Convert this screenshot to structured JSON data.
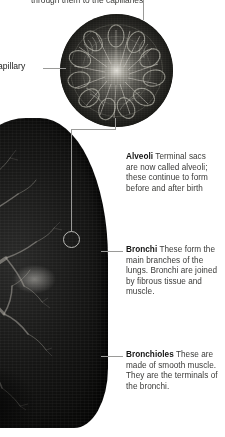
{
  "page": {
    "figure_type": "anatomical-illustration"
  },
  "top_fragment": {
    "text": "through them to the capillaries"
  },
  "side_label": {
    "text": "apillary",
    "full_word": "Capillary"
  },
  "callouts": [
    {
      "id": "alveoli",
      "term": "Alveoli",
      "body": "Terminal sacs are now called alveoli; these continue to form before and after birth"
    },
    {
      "id": "bronchi",
      "term": "Bronchi",
      "body": "These form the main branches of the lungs. Bronchi are joined by fibrous tissue and muscle."
    },
    {
      "id": "bronchioles",
      "term": "Bronchioles",
      "body": "These are made of smooth muscle. They are the terminals of the bronchi."
    }
  ],
  "images": {
    "inset_caption": "alveoli-micrograph",
    "lung_caption": "lung-bronchial-tree-photograph"
  },
  "colors": {
    "page_background": "#ffffff",
    "text": "#3a3a38",
    "term": "#141413",
    "leader_line": "#9a9a98",
    "lung_dark": "#0b0b0a",
    "inset_mid": "#55544f"
  }
}
